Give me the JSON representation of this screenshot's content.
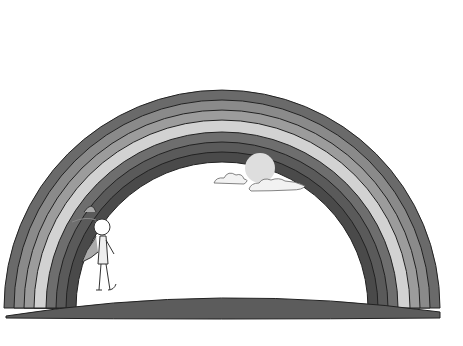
{
  "scene": {
    "description": "Grayscale illustration of a rainbow arching over a ground strip, with a sun behind clouds and a small cartoon child walking",
    "background": "#ffffff",
    "rainbow": {
      "center_x": 222,
      "base_y": 305,
      "bands": [
        {
          "radius": 218,
          "color": "#6a6a6a"
        },
        {
          "radius": 208,
          "color": "#8a8a8a"
        },
        {
          "radius": 198,
          "color": "#9c9c9c"
        },
        {
          "radius": 188,
          "color": "#d2d2d2"
        },
        {
          "radius": 176,
          "color": "#6e6e6e"
        },
        {
          "radius": 166,
          "color": "#5a5a5a"
        },
        {
          "radius": 156,
          "color": "#4a4a4a"
        }
      ],
      "inner_radius": 146
    },
    "ground": {
      "color": "#5c5c5c"
    },
    "sun": {
      "color": "#dedede"
    },
    "clouds": {
      "fill": "#f2f2f2",
      "stroke": "#666666"
    }
  }
}
